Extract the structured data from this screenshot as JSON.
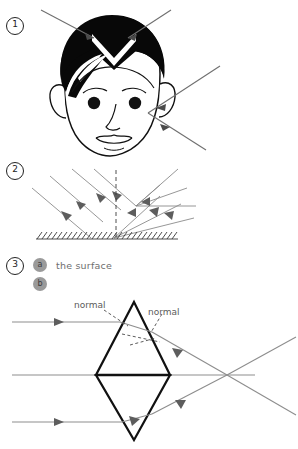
{
  "page": {
    "background_color": "#ffffff",
    "width": 298,
    "height": 449
  },
  "items": [
    {
      "number": "1",
      "name": "head-diffuse-reflection",
      "description": "Head illustration with incoming light ray arrows"
    },
    {
      "number": "2",
      "name": "specular-reflection-surface",
      "description": "Parallel rays reflecting off a hatched flat surface with dashed normal"
    },
    {
      "number": "3",
      "name": "prism-refraction",
      "description": "Rhombus prism refracting three parallel rays to a focal point"
    }
  ],
  "labels": {
    "badge_a": "a",
    "badge_b": "b",
    "the_surface": "the surface",
    "normal_left": "normal",
    "normal_right": "normal"
  },
  "colors": {
    "ink": "#1a1a1a",
    "ray": "#7a7a7a",
    "ray_dark": "#5a5a5a",
    "badge_fill": "#9a9a9a",
    "badge_text": "#3c3c3c",
    "label_text": "#6e6e6e",
    "prism_stroke": "#111111",
    "hair": "#080808"
  }
}
